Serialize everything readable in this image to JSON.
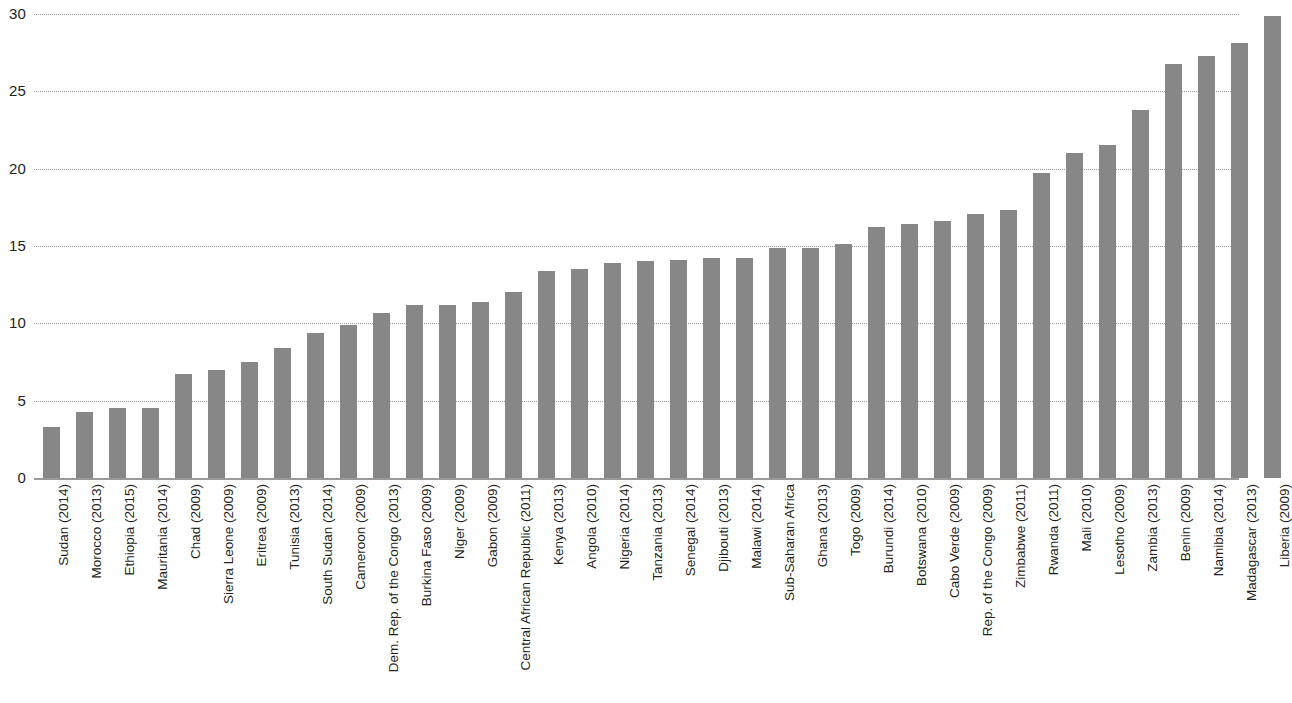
{
  "chart_data": {
    "type": "bar",
    "title": "",
    "subtitle": "",
    "xlabel": "",
    "ylabel": "",
    "ylim": [
      0,
      30
    ],
    "y_ticks": [
      0,
      5,
      10,
      15,
      20,
      25,
      30
    ],
    "y_tick_labels": [
      "0",
      "5",
      "10",
      "15",
      "20",
      "25",
      "30"
    ],
    "grid": true,
    "grid_style": "dotted-horizontal",
    "legend": "none",
    "bar_color": "#878787",
    "axis_color": "#9a9a9a",
    "text_color": "#231f20",
    "categories": [
      "Sudan (2014)",
      "Morocco (2013)",
      "Ethiopia (2015)",
      "Mauritania (2014)",
      "Chad (2009)",
      "Sierra Leone (2009)",
      "Eritrea (2009)",
      "Tunisia (2013)",
      "South Sudan (2014)",
      "Cameroon (2009)",
      "Dem. Rep. of the Congo (2013)",
      "Burkina Faso (2009)",
      "Niger (2009)",
      "Gabon (2009)",
      "Central African Republic (2011)",
      "Kenya (2013)",
      "Angola (2010)",
      "Nigeria (2014)",
      "Tanzania (2013)",
      "Senegal (2014)",
      "Djibouti (2013)",
      "Malawi (2014)",
      "Sub-Saharan Africa",
      "Ghana (2013)",
      "Togo (2009)",
      "Burundi (2014)",
      "Botswana (2010)",
      "Cabo Verde (2009)",
      "Rep. of the Congo (2009)",
      "Zimbabwe (2011)",
      "Rwanda (2011)",
      "Mali (2010)",
      "Lesotho (2009)",
      "Zambia (2013)",
      "Benin (2009)",
      "Namibia (2014)",
      "Madagascar (2013)",
      "Liberia (2009)"
    ],
    "values": [
      3.3,
      4.3,
      4.5,
      4.5,
      6.7,
      7.0,
      7.5,
      8.4,
      9.4,
      9.9,
      10.7,
      11.2,
      11.2,
      11.4,
      12.0,
      13.4,
      13.5,
      13.9,
      14.0,
      14.1,
      14.2,
      14.2,
      14.9,
      14.9,
      15.1,
      16.2,
      16.4,
      16.6,
      17.1,
      17.3,
      19.7,
      21.0,
      21.5,
      23.8,
      26.8,
      27.3,
      28.1,
      29.9
    ]
  }
}
